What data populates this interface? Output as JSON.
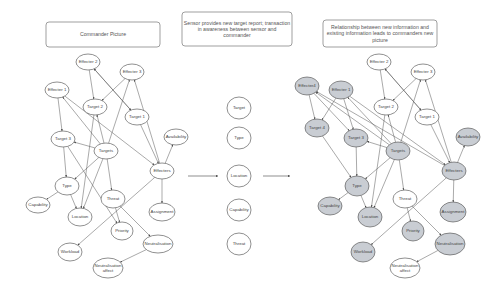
{
  "panels": {
    "left": {
      "title_box": {
        "x": 46,
        "y": 22,
        "w": 114,
        "h": 25,
        "lines": [
          "Commander Picture"
        ]
      },
      "nodes": [
        {
          "id": "effecter2",
          "label": [
            "Effecter 2"
          ],
          "x": 88,
          "y": 62,
          "rx": 12,
          "ry": 8,
          "shaded": false
        },
        {
          "id": "effecter3",
          "label": [
            "Effecter 3"
          ],
          "x": 132,
          "y": 72,
          "rx": 12,
          "ry": 8,
          "shaded": false
        },
        {
          "id": "effecter1",
          "label": [
            "Effecter 1"
          ],
          "x": 57,
          "y": 90,
          "rx": 12,
          "ry": 8,
          "shaded": false
        },
        {
          "id": "target2",
          "label": [
            "Target 2"
          ],
          "x": 95,
          "y": 107,
          "rx": 12,
          "ry": 8,
          "shaded": false
        },
        {
          "id": "target1",
          "label": [
            "Target 1"
          ],
          "x": 137,
          "y": 117,
          "rx": 12,
          "ry": 8,
          "shaded": false
        },
        {
          "id": "target3",
          "label": [
            "Target 3"
          ],
          "x": 63,
          "y": 139,
          "rx": 12,
          "ry": 8,
          "shaded": false
        },
        {
          "id": "availability",
          "label": [
            "Availability"
          ],
          "x": 176,
          "y": 137,
          "rx": 12,
          "ry": 8,
          "shaded": false
        },
        {
          "id": "targets",
          "label": [
            "Targets"
          ],
          "x": 106,
          "y": 151,
          "rx": 12,
          "ry": 8,
          "shaded": false
        },
        {
          "id": "effecters",
          "label": [
            "Effecters"
          ],
          "x": 162,
          "y": 171,
          "rx": 12,
          "ry": 8,
          "shaded": false
        },
        {
          "id": "type",
          "label": [
            "Type"
          ],
          "x": 67,
          "y": 186,
          "rx": 12,
          "ry": 9,
          "shaded": false
        },
        {
          "id": "capability",
          "label": [
            "Capability"
          ],
          "x": 38,
          "y": 205,
          "rx": 12,
          "ry": 8,
          "shaded": false
        },
        {
          "id": "location",
          "label": [
            "Location"
          ],
          "x": 80,
          "y": 217,
          "rx": 12,
          "ry": 9,
          "shaded": false
        },
        {
          "id": "threat",
          "label": [
            "Threat"
          ],
          "x": 113,
          "y": 199,
          "rx": 12,
          "ry": 9,
          "shaded": false
        },
        {
          "id": "assignment",
          "label": [
            "Assignment"
          ],
          "x": 162,
          "y": 212,
          "rx": 13,
          "ry": 9,
          "shaded": false
        },
        {
          "id": "priority",
          "label": [
            "Priority"
          ],
          "x": 122,
          "y": 231,
          "rx": 11,
          "ry": 9,
          "shaded": false
        },
        {
          "id": "workload",
          "label": [
            "Workload"
          ],
          "x": 70,
          "y": 252,
          "rx": 12,
          "ry": 9,
          "shaded": false
        },
        {
          "id": "neutralisation",
          "label": [
            "Neutralisation"
          ],
          "x": 158,
          "y": 244,
          "rx": 15,
          "ry": 9,
          "shaded": false
        },
        {
          "id": "neutralisation_affect",
          "label": [
            "Neutralisation",
            "affect"
          ],
          "x": 108,
          "y": 268,
          "rx": 15,
          "ry": 10,
          "shaded": false
        }
      ],
      "edges": [
        [
          "effecter2",
          "target2"
        ],
        [
          "effecter2",
          "target1"
        ],
        [
          "target1",
          "effecter2"
        ],
        [
          "effecter3",
          "target2"
        ],
        [
          "effecter1",
          "target3"
        ],
        [
          "targets",
          "effecter1"
        ],
        [
          "targets",
          "effecter3"
        ],
        [
          "effecters",
          "effecter3"
        ],
        [
          "targets",
          "target2"
        ],
        [
          "targets",
          "target3"
        ],
        [
          "target1",
          "effecters"
        ],
        [
          "effecters",
          "availability"
        ],
        [
          "effecter1",
          "effecters"
        ],
        [
          "targets",
          "type"
        ],
        [
          "targets",
          "location"
        ],
        [
          "targets",
          "threat"
        ],
        [
          "target3",
          "priority"
        ],
        [
          "target3",
          "type"
        ],
        [
          "type",
          "capability"
        ],
        [
          "type",
          "location"
        ],
        [
          "target2",
          "location"
        ],
        [
          "effecters",
          "assignment"
        ],
        [
          "effecters",
          "workload"
        ],
        [
          "threat",
          "priority"
        ],
        [
          "threat",
          "neutralisation"
        ],
        [
          "neutralisation",
          "neutralisation_affect"
        ]
      ]
    },
    "middle": {
      "title_box": {
        "x": 182,
        "y": 12,
        "w": 110,
        "h": 34,
        "lines": [
          "Sensor provides new target report; transaction",
          "in awareness between sensor and",
          "commander"
        ]
      },
      "nodes": [
        {
          "id": "m_target",
          "label": [
            "Target"
          ],
          "x": 239,
          "y": 108,
          "rx": 12,
          "ry": 11,
          "shaded": false
        },
        {
          "id": "m_type",
          "label": [
            "Type"
          ],
          "x": 239,
          "y": 138,
          "rx": 12,
          "ry": 11,
          "shaded": false
        },
        {
          "id": "m_location",
          "label": [
            "Location"
          ],
          "x": 239,
          "y": 176,
          "rx": 12,
          "ry": 11,
          "shaded": false
        },
        {
          "id": "m_capability",
          "label": [
            "Capability"
          ],
          "x": 239,
          "y": 210,
          "rx": 12,
          "ry": 11,
          "shaded": false
        },
        {
          "id": "m_threat",
          "label": [
            "Threat"
          ],
          "x": 239,
          "y": 244,
          "rx": 12,
          "ry": 11,
          "shaded": false
        }
      ],
      "flow_arrows": [
        {
          "x1": 188,
          "y1": 176,
          "x2": 218,
          "y2": 176
        },
        {
          "x1": 263,
          "y1": 176,
          "x2": 290,
          "y2": 176
        }
      ]
    },
    "right": {
      "title_box": {
        "x": 323,
        "y": 20,
        "w": 114,
        "h": 27,
        "lines": [
          "Relationship between new information and",
          "existing information leads to commanders new",
          "picture"
        ]
      },
      "nodes": [
        {
          "id": "effecter2",
          "label": [
            "Effecter 2"
          ],
          "x": 379,
          "y": 62,
          "rx": 12,
          "ry": 8,
          "shaded": false
        },
        {
          "id": "effecter3",
          "label": [
            "Effecter 3"
          ],
          "x": 423,
          "y": 72,
          "rx": 12,
          "ry": 8,
          "shaded": false
        },
        {
          "id": "effecter4",
          "label": [
            "Effecter4"
          ],
          "x": 307,
          "y": 86,
          "rx": 12,
          "ry": 9,
          "shaded": true
        },
        {
          "id": "effecter1",
          "label": [
            "Effecter 1"
          ],
          "x": 341,
          "y": 90,
          "rx": 12,
          "ry": 9,
          "shaded": true
        },
        {
          "id": "target2",
          "label": [
            "Target 2"
          ],
          "x": 386,
          "y": 107,
          "rx": 12,
          "ry": 8,
          "shaded": false
        },
        {
          "id": "target1",
          "label": [
            "Target 1"
          ],
          "x": 427,
          "y": 117,
          "rx": 12,
          "ry": 8,
          "shaded": false
        },
        {
          "id": "target4",
          "label": [
            "Target 4"
          ],
          "x": 317,
          "y": 128,
          "rx": 12,
          "ry": 9,
          "shaded": true
        },
        {
          "id": "target3",
          "label": [
            "Target 3"
          ],
          "x": 356,
          "y": 138,
          "rx": 12,
          "ry": 9,
          "shaded": true
        },
        {
          "id": "availability",
          "label": [
            "Availability"
          ],
          "x": 468,
          "y": 137,
          "rx": 12,
          "ry": 9,
          "shaded": true
        },
        {
          "id": "targets",
          "label": [
            "Targets"
          ],
          "x": 398,
          "y": 151,
          "rx": 12,
          "ry": 9,
          "shaded": true
        },
        {
          "id": "effecters",
          "label": [
            "Effecters"
          ],
          "x": 454,
          "y": 171,
          "rx": 12,
          "ry": 9,
          "shaded": true
        },
        {
          "id": "type",
          "label": [
            "Type"
          ],
          "x": 357,
          "y": 186,
          "rx": 12,
          "ry": 10,
          "shaded": true
        },
        {
          "id": "capability",
          "label": [
            "Capability"
          ],
          "x": 330,
          "y": 206,
          "rx": 12,
          "ry": 9,
          "shaded": true
        },
        {
          "id": "location",
          "label": [
            "Location"
          ],
          "x": 370,
          "y": 217,
          "rx": 12,
          "ry": 10,
          "shaded": true
        },
        {
          "id": "threat",
          "label": [
            "Threat"
          ],
          "x": 405,
          "y": 199,
          "rx": 12,
          "ry": 9,
          "shaded": false
        },
        {
          "id": "assignment",
          "label": [
            "Assignment"
          ],
          "x": 453,
          "y": 212,
          "rx": 13,
          "ry": 10,
          "shaded": true
        },
        {
          "id": "priority",
          "label": [
            "Priority"
          ],
          "x": 413,
          "y": 231,
          "rx": 11,
          "ry": 10,
          "shaded": true
        },
        {
          "id": "workload",
          "label": [
            "Workload"
          ],
          "x": 363,
          "y": 252,
          "rx": 12,
          "ry": 10,
          "shaded": true
        },
        {
          "id": "neutralisation",
          "label": [
            "Neutralisation"
          ],
          "x": 450,
          "y": 244,
          "rx": 15,
          "ry": 11,
          "shaded": true
        },
        {
          "id": "neutralisation_affect",
          "label": [
            "Neutralisation",
            "affect"
          ],
          "x": 405,
          "y": 268,
          "rx": 15,
          "ry": 10,
          "shaded": false
        }
      ],
      "edges": [
        [
          "effecter2",
          "target2"
        ],
        [
          "effecter2",
          "target1"
        ],
        [
          "target1",
          "effecter2"
        ],
        [
          "effecter3",
          "target2"
        ],
        [
          "effecter1",
          "target3"
        ],
        [
          "effecter1",
          "target4"
        ],
        [
          "effecter4",
          "target4"
        ],
        [
          "effecter4",
          "target3"
        ],
        [
          "targets",
          "effecter1"
        ],
        [
          "targets",
          "effecter4"
        ],
        [
          "effecters",
          "effecter4"
        ],
        [
          "targets",
          "effecter3"
        ],
        [
          "effecters",
          "effecter3"
        ],
        [
          "targets",
          "target2"
        ],
        [
          "targets",
          "target3"
        ],
        [
          "target1",
          "effecters"
        ],
        [
          "effecters",
          "availability"
        ],
        [
          "effecter1",
          "effecters"
        ],
        [
          "targets",
          "type"
        ],
        [
          "targets",
          "location"
        ],
        [
          "targets",
          "threat"
        ],
        [
          "target4",
          "type"
        ],
        [
          "target3",
          "type"
        ],
        [
          "type",
          "capability"
        ],
        [
          "type",
          "location"
        ],
        [
          "target2",
          "location"
        ],
        [
          "effecters",
          "assignment"
        ],
        [
          "effecters",
          "workload"
        ],
        [
          "threat",
          "priority"
        ],
        [
          "threat",
          "neutralisation"
        ],
        [
          "neutralisation",
          "neutralisation_affect"
        ]
      ]
    }
  },
  "colors": {
    "shaded_node": "#c9cdd3",
    "plain_node": "#ffffff",
    "stroke": "#444444"
  }
}
